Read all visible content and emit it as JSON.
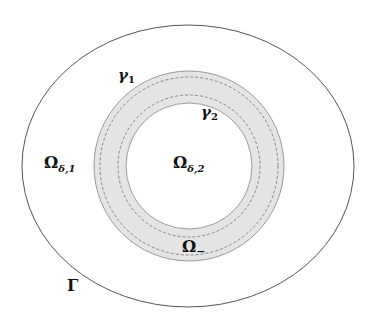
{
  "diagram": {
    "type": "domain-decomposition",
    "colors": {
      "background": "#ffffff",
      "outer_boundary": "#555555",
      "annulus_fill": "#e4e4e4",
      "annulus_edge": "#9a9a9a",
      "dashed_curve": "#7a7a7a",
      "text": "#111111"
    },
    "shapes": {
      "outer_boundary": {
        "name": "Gamma",
        "cx": 188,
        "cy": 166,
        "rx": 166,
        "ry": 141
      },
      "annulus_outer": {
        "cx": 189,
        "cy": 166,
        "r": 95
      },
      "gamma1_curve": {
        "cx": 189,
        "cy": 166,
        "r": 89
      },
      "gamma2_curve": {
        "cx": 189,
        "cy": 166,
        "r": 71
      },
      "annulus_inner": {
        "cx": 189,
        "cy": 166,
        "r": 63
      }
    },
    "labels": {
      "gamma1": {
        "main": "γ",
        "sub": "1"
      },
      "gamma2": {
        "main": "γ",
        "sub": "2"
      },
      "omega_delta_1": {
        "main": "Ω",
        "sub": "δ,1"
      },
      "omega_delta_2": {
        "main": "Ω",
        "sub": "δ,2"
      },
      "omega_minus": {
        "main": "Ω",
        "sub": "−"
      },
      "boundary_gamma": {
        "main": "Γ"
      }
    }
  }
}
